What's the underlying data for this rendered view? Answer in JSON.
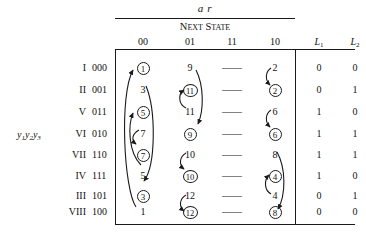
{
  "header": {
    "input_label": "a r",
    "next_state_label": "Next State",
    "state_var_label": "y₁y₂y₃",
    "columns": [
      "00",
      "01",
      "11",
      "10"
    ],
    "output_columns": [
      "L₁",
      "L₂"
    ]
  },
  "rows": [
    {
      "roman": "I",
      "bits": "000",
      "n00": "1",
      "n00_circled": true,
      "n01": "9",
      "n01_circled": false,
      "n11": "——",
      "n10": "2",
      "n10_circled": false,
      "L1": "0",
      "L2": "0"
    },
    {
      "roman": "II",
      "bits": "001",
      "n00": "3",
      "n00_circled": false,
      "n01": "11",
      "n01_circled": true,
      "n11": "——",
      "n10": "2",
      "n10_circled": true,
      "L1": "0",
      "L2": "1"
    },
    {
      "roman": "V",
      "bits": "011",
      "n00": "5",
      "n00_circled": true,
      "n01": "11",
      "n01_circled": false,
      "n11": "——",
      "n10": "6",
      "n10_circled": false,
      "L1": "1",
      "L2": "0"
    },
    {
      "roman": "VI",
      "bits": "010",
      "n00": "7",
      "n00_circled": false,
      "n01": "9",
      "n01_circled": true,
      "n11": "——",
      "n10": "6",
      "n10_circled": true,
      "L1": "1",
      "L2": "1"
    },
    {
      "roman": "VII",
      "bits": "110",
      "n00": "7",
      "n00_circled": true,
      "n01": "10",
      "n01_circled": false,
      "n11": "——",
      "n10": "8",
      "n10_circled": false,
      "L1": "1",
      "L2": "1"
    },
    {
      "roman": "IV",
      "bits": "111",
      "n00": "5",
      "n00_circled": false,
      "n01": "10",
      "n01_circled": true,
      "n11": "——",
      "n10": "4",
      "n10_circled": true,
      "L1": "1",
      "L2": "0"
    },
    {
      "roman": "III",
      "bits": "101",
      "n00": "3",
      "n00_circled": true,
      "n01": "12",
      "n01_circled": false,
      "n11": "——",
      "n10": "4",
      "n10_circled": false,
      "L1": "0",
      "L2": "1"
    },
    {
      "roman": "VIII",
      "bits": "100",
      "n00": "1",
      "n00_circled": false,
      "n01": "12",
      "n01_circled": true,
      "n11": "——",
      "n10": "8",
      "n10_circled": true,
      "L1": "0",
      "L2": "0"
    }
  ]
}
